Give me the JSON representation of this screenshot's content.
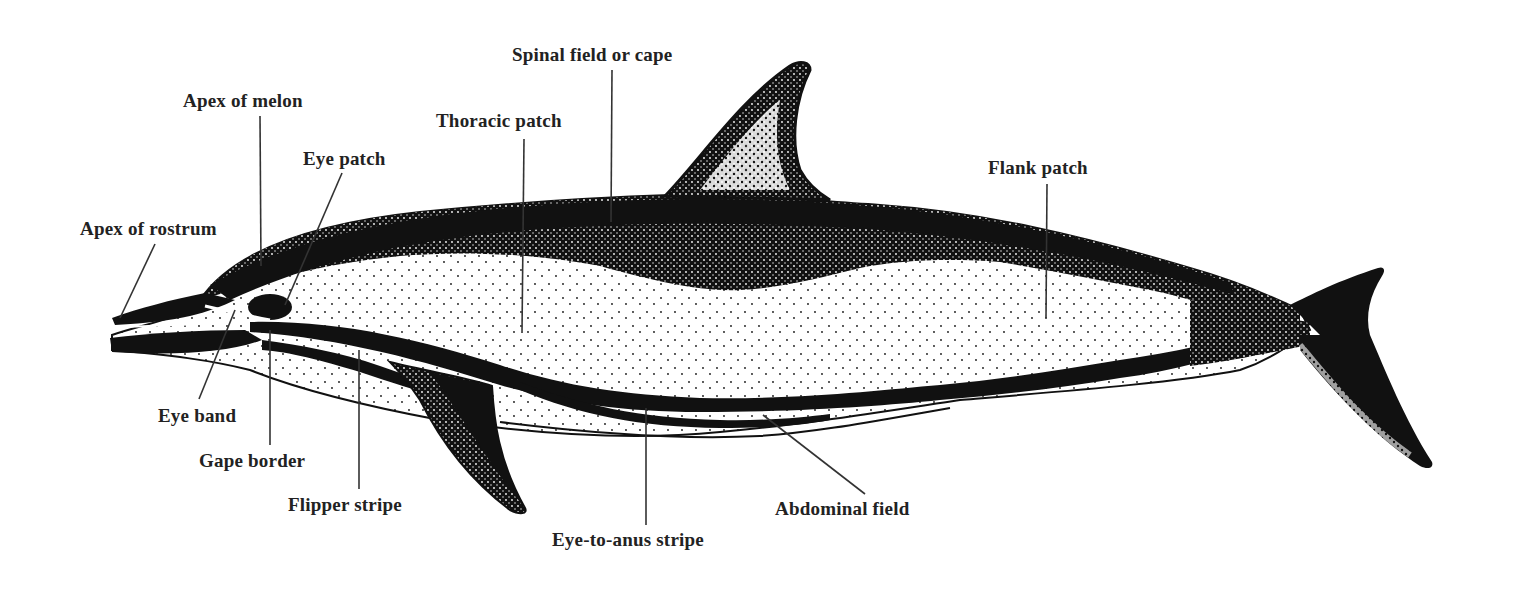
{
  "diagram": {
    "colors": {
      "ink": "#111111",
      "label": "#222222",
      "leader": "#333333",
      "background": "#ffffff"
    },
    "labels": [
      {
        "id": "apex-of-rostrum",
        "text": "Apex of rostrum",
        "x": 80,
        "y": 220,
        "line": [
          155,
          244,
          120,
          318
        ]
      },
      {
        "id": "apex-of-melon",
        "text": "Apex of melon",
        "x": 183,
        "y": 92,
        "line": [
          260,
          116,
          261,
          266
        ]
      },
      {
        "id": "eye-patch",
        "text": "Eye patch",
        "x": 303,
        "y": 150,
        "line": [
          342,
          173,
          285,
          305
        ]
      },
      {
        "id": "thoracic-patch",
        "text": "Thoracic patch",
        "x": 436,
        "y": 112,
        "line": [
          524,
          139,
          522,
          333
        ]
      },
      {
        "id": "spinal-field-or-cape",
        "text": "Spinal field or cape",
        "x": 512,
        "y": 46,
        "line": [
          612,
          70,
          611,
          222
        ]
      },
      {
        "id": "flank-patch",
        "text": "Flank patch",
        "x": 988,
        "y": 159,
        "line": [
          1047,
          184,
          1046,
          318
        ]
      },
      {
        "id": "eye-band",
        "text": "Eye band",
        "x": 158,
        "y": 406,
        "line": [
          199,
          399,
          235,
          310
        ]
      },
      {
        "id": "gape-border",
        "text": "Gape border",
        "x": 199,
        "y": 451,
        "line": [
          270,
          445,
          270,
          330
        ]
      },
      {
        "id": "flipper-stripe",
        "text": "Flipper stripe",
        "x": 288,
        "y": 495,
        "line": [
          359,
          489,
          359,
          350
        ]
      },
      {
        "id": "eye-to-anus-stripe",
        "text": "Eye-to-anus stripe",
        "x": 552,
        "y": 530,
        "line": [
          646,
          525,
          646,
          408
        ]
      },
      {
        "id": "abdominal-field",
        "text": "Abdominal field",
        "x": 775,
        "y": 500,
        "line": [
          865,
          494,
          763,
          415
        ]
      }
    ]
  }
}
